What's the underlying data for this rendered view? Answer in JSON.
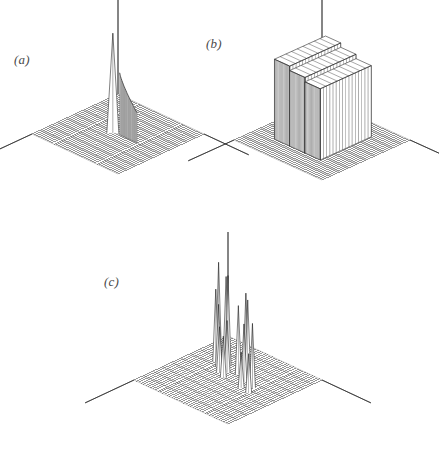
{
  "figure": {
    "background_color": "#ffffff",
    "ink_color": "#2b2b2b",
    "label_color": "#4a4a4a",
    "width": 439,
    "height": 454,
    "style": "scanned line-drawing wireframe surface plots, monochrome"
  },
  "panels": [
    {
      "id": "a",
      "label": "(a)",
      "label_x": 14,
      "label_y": 52,
      "origin_x": 18,
      "origin_y": 8,
      "description": "flat wireframe mesh plane with one tall narrow spike and an adjacent curved ridge wall"
    },
    {
      "id": "b",
      "label": "(b)",
      "label_x": 206,
      "label_y": 36,
      "origin_x": 214,
      "origin_y": 8,
      "description": "flat wireframe mesh plane with a large stepped plateau mesa block of near-uniform height"
    },
    {
      "id": "c",
      "label": "(c)",
      "label_x": 104,
      "label_y": 274,
      "origin_x": 110,
      "origin_y": 258,
      "description": "flat wireframe mesh plane with many thin spikes of varying heights scattered across it"
    }
  ],
  "chart_data": [
    {
      "type": "surface",
      "panel": "a",
      "title": "(a)",
      "xlabel": "",
      "ylabel": "",
      "zlabel": "",
      "grid": true,
      "grid_rows": 34,
      "grid_cols": 34,
      "axes": [
        "x-axis to lower-left",
        "y-axis to lower-right",
        "z-axis vertical"
      ],
      "features": [
        {
          "kind": "spike",
          "u": 0.46,
          "v": 0.52,
          "height": 1.0,
          "width": 0.035
        },
        {
          "kind": "ridge-wall",
          "u_start": 0.52,
          "u_end": 0.72,
          "v": 0.5,
          "height_start": 0.62,
          "height_end": 0.3
        }
      ],
      "baseline": 0.0,
      "zlim": [
        0,
        1
      ]
    },
    {
      "type": "surface",
      "panel": "b",
      "title": "(b)",
      "xlabel": "",
      "ylabel": "",
      "zlabel": "",
      "grid": true,
      "grid_rows": 34,
      "grid_cols": 34,
      "axes": [
        "x-axis to lower-left",
        "y-axis to lower-right",
        "z-axis vertical"
      ],
      "features": [
        {
          "kind": "plateau",
          "u_start": 0.22,
          "u_end": 0.74,
          "v_start": 0.18,
          "v_end": 0.76,
          "height": 0.8,
          "steps": 3
        }
      ],
      "baseline": 0.0,
      "zlim": [
        0,
        1
      ]
    },
    {
      "type": "surface",
      "panel": "c",
      "title": "(c)",
      "xlabel": "",
      "ylabel": "",
      "zlabel": "",
      "grid": true,
      "grid_rows": 34,
      "grid_cols": 34,
      "axes": [
        "x-axis to lower-left",
        "y-axis to lower-right",
        "z-axis vertical"
      ],
      "features": [
        {
          "kind": "spike",
          "u": 0.2,
          "v": 0.3,
          "height": 0.92
        },
        {
          "kind": "spike",
          "u": 0.23,
          "v": 0.36,
          "height": 0.7
        },
        {
          "kind": "spike",
          "u": 0.26,
          "v": 0.28,
          "height": 0.8
        },
        {
          "kind": "spike",
          "u": 0.3,
          "v": 0.4,
          "height": 0.6
        },
        {
          "kind": "spike",
          "u": 0.33,
          "v": 0.33,
          "height": 0.86
        },
        {
          "kind": "spike",
          "u": 0.37,
          "v": 0.46,
          "height": 0.44
        },
        {
          "kind": "spike",
          "u": 0.41,
          "v": 0.42,
          "height": 0.5
        },
        {
          "kind": "spike",
          "u": 0.45,
          "v": 0.5,
          "height": 0.4
        },
        {
          "kind": "spike",
          "u": 0.49,
          "v": 0.38,
          "height": 0.66
        },
        {
          "kind": "spike",
          "u": 0.53,
          "v": 0.34,
          "height": 0.78
        },
        {
          "kind": "spike",
          "u": 0.57,
          "v": 0.36,
          "height": 0.74
        },
        {
          "kind": "spike",
          "u": 0.61,
          "v": 0.44,
          "height": 0.56
        },
        {
          "kind": "spike",
          "u": 0.66,
          "v": 0.52,
          "height": 0.34
        },
        {
          "kind": "spike",
          "u": 0.72,
          "v": 0.46,
          "height": 0.62
        },
        {
          "kind": "spike",
          "u": 0.76,
          "v": 0.54,
          "height": 0.38
        }
      ],
      "baseline": 0.0,
      "zlim": [
        0,
        1
      ]
    }
  ]
}
